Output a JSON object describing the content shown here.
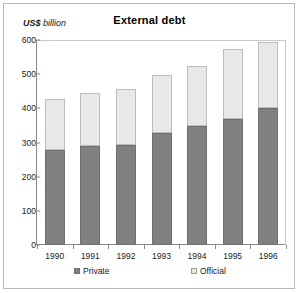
{
  "figure": {
    "title": "External debt",
    "axis_caption_unit": "US$",
    "axis_caption_measure": "billion"
  },
  "legend": {
    "private_label": "Private",
    "official_label": "Official",
    "private_color": "#808080",
    "official_color": "#e8e8e8"
  },
  "axes": {
    "y_ticks": [
      "0",
      "100",
      "200",
      "300",
      "400",
      "500",
      "600"
    ],
    "x_ticks": [
      "1990",
      "1991",
      "1992",
      "1993",
      "1994",
      "1995",
      "1996"
    ]
  },
  "chart_data": {
    "type": "bar",
    "title": "External debt",
    "xlabel": "",
    "ylabel": "US$ billion",
    "ylim": [
      0,
      600
    ],
    "yticks": [
      0,
      100,
      200,
      300,
      400,
      500,
      600
    ],
    "grid": false,
    "stacked": true,
    "legend_position": "bottom",
    "categories": [
      "1990",
      "1991",
      "1992",
      "1993",
      "1994",
      "1995",
      "1996"
    ],
    "series": [
      {
        "name": "Private",
        "color": "#808080",
        "values": [
          277,
          289,
          293,
          327,
          347,
          368,
          400
        ]
      },
      {
        "name": "Official",
        "color": "#e8e8e8",
        "values": [
          150,
          156,
          163,
          170,
          176,
          205,
          194
        ]
      }
    ],
    "totals": [
      427,
      445,
      456,
      497,
      523,
      573,
      594
    ]
  }
}
